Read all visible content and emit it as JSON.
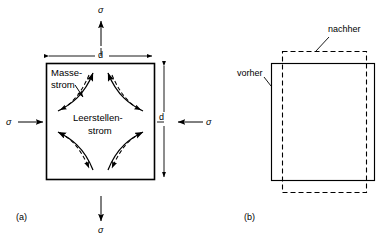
{
  "figure": {
    "panels": [
      {
        "tag": "(a)",
        "tag_name": "panel-a-tag",
        "stress_symbol": "σ",
        "stress_labels": [
          {
            "name": "stress-top",
            "text": "σ",
            "direction": "up",
            "sense": "tension"
          },
          {
            "name": "stress-bottom",
            "text": "σ",
            "direction": "down",
            "sense": "tension"
          },
          {
            "name": "stress-left",
            "text": "σ",
            "direction": "right",
            "sense": "compression"
          },
          {
            "name": "stress-right",
            "text": "σ",
            "direction": "left",
            "sense": "compression"
          }
        ],
        "dimensions": [
          {
            "name": "dimension-width",
            "text": "d",
            "orientation": "horizontal"
          },
          {
            "name": "dimension-height",
            "text": "d",
            "orientation": "vertical"
          }
        ],
        "flow_labels": [
          {
            "name": "mass-flow-label",
            "line1": "Masse-",
            "line2": "strom",
            "style": "solid"
          },
          {
            "name": "vacancy-flow-label",
            "line1": "Leerstellen-",
            "line2": "strom",
            "style": "dashed"
          }
        ]
      },
      {
        "tag": "(b)",
        "tag_name": "panel-b-tag",
        "shape_labels": [
          {
            "name": "before-label",
            "text": "vorher",
            "style": "solid"
          },
          {
            "name": "after-label",
            "text": "nachher",
            "style": "dashed"
          }
        ]
      }
    ],
    "colors": {
      "stroke": "#000000",
      "background": "#ffffff"
    }
  }
}
